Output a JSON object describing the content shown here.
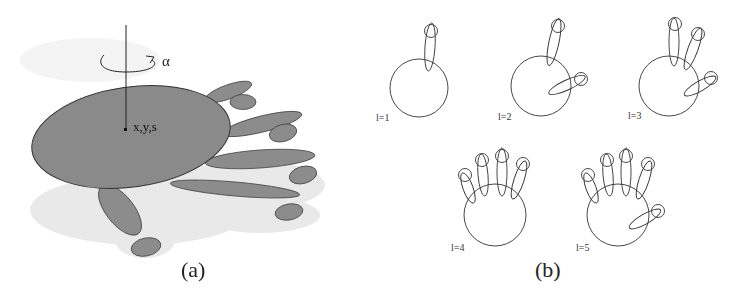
{
  "figure": {
    "panel_a": {
      "caption": "(a)",
      "axis_label": "x,y,s",
      "rotation_label": "α",
      "fill_color": "#8a8a8a",
      "shadow_color": "#e0e0e0"
    },
    "panel_b": {
      "caption": "(b)",
      "states": [
        {
          "label": "l=1"
        },
        {
          "label": "l=2"
        },
        {
          "label": "l=3"
        },
        {
          "label": "l=4"
        },
        {
          "label": "l=5"
        }
      ]
    }
  }
}
